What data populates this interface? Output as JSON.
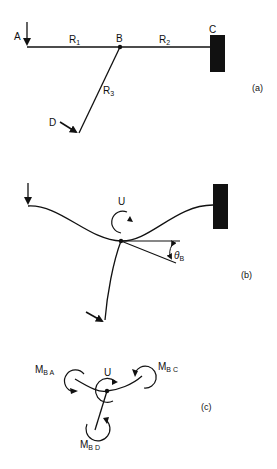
{
  "panels": {
    "a": {
      "label": "(a)",
      "nodes": {
        "A": "A",
        "B": "B",
        "C": "C",
        "D": "D"
      },
      "members": {
        "r1": {
          "base": "R",
          "sub": "1"
        },
        "r2": {
          "base": "R",
          "sub": "2"
        },
        "r3": {
          "base": "R",
          "sub": "3"
        }
      }
    },
    "b": {
      "label": "(b)",
      "rotation_label": "U",
      "angle": {
        "base": "θ",
        "sub": "B"
      }
    },
    "c": {
      "label": "(c)",
      "rotation_label": "U",
      "moments": {
        "mba": {
          "base": "M",
          "sub": "B A"
        },
        "mbc": {
          "base": "M",
          "sub": "B C"
        },
        "mbd": {
          "base": "M",
          "sub": "B D"
        }
      }
    }
  }
}
